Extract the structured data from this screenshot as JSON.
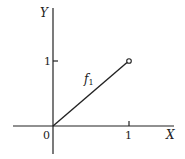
{
  "figure": {
    "axes": {
      "x_label": "X",
      "y_label": "Y",
      "origin_label": "0",
      "x_tick_label": "1",
      "y_tick_label": "1"
    },
    "function": {
      "name": "f",
      "subscript": "1",
      "from_point": [
        0,
        0
      ],
      "to_point": [
        1,
        1
      ],
      "endpoint_style": "open-circle"
    },
    "colors": {
      "line": "#222222",
      "background": "#ffffff"
    }
  }
}
